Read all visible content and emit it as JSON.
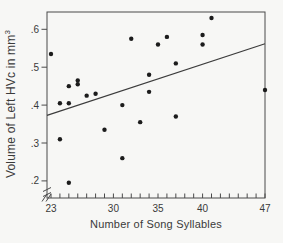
{
  "figure": {
    "x_axis_label": "Number of Song Syllables",
    "y_axis_label_text": "Volume of Left HVc in mm",
    "y_axis_label_exponent": "3"
  },
  "chart_data": {
    "type": "scatter",
    "title": "",
    "xlabel": "Number of Song Syllables",
    "ylabel": "Volume of Left HVc in mm^3",
    "xlim": [
      22.5,
      47
    ],
    "ylim": [
      0.155,
      0.645
    ],
    "x_major_ticks": [
      23,
      30,
      35,
      40,
      47
    ],
    "x_minor_tick_start": 23,
    "x_minor_tick_end": 47,
    "x_minor_tick_step": 1,
    "y_ticks": [
      0.2,
      0.3,
      0.4,
      0.5,
      0.6
    ],
    "y_tick_labels": [
      ".2",
      ".3",
      ".4",
      ".5",
      ".6"
    ],
    "grid": false,
    "legend": false,
    "axis_breaks": [
      "x-axis-near-origin",
      "y-axis-below-lowest-tick"
    ],
    "points": [
      [
        23,
        0.535
      ],
      [
        24,
        0.405
      ],
      [
        24,
        0.31
      ],
      [
        25,
        0.405
      ],
      [
        25,
        0.45
      ],
      [
        25,
        0.195
      ],
      [
        26,
        0.465
      ],
      [
        26,
        0.455
      ],
      [
        27,
        0.425
      ],
      [
        28,
        0.43
      ],
      [
        29,
        0.335
      ],
      [
        31,
        0.4
      ],
      [
        31,
        0.26
      ],
      [
        32,
        0.575
      ],
      [
        33,
        0.355
      ],
      [
        34,
        0.48
      ],
      [
        34,
        0.435
      ],
      [
        35,
        0.56
      ],
      [
        36,
        0.58
      ],
      [
        37,
        0.51
      ],
      [
        37,
        0.37
      ],
      [
        40,
        0.585
      ],
      [
        40,
        0.56
      ],
      [
        41,
        0.63
      ],
      [
        47,
        0.44
      ]
    ],
    "trend_line": {
      "x1": 22.55,
      "y1": 0.373,
      "x2": 47.0,
      "y2": 0.562
    }
  },
  "colors": {
    "ink": "#4a4a4a",
    "text": "#3a3a3a",
    "point": "#1c1c1c",
    "line": "#3c3c3c",
    "background": "#f7f7f5"
  }
}
